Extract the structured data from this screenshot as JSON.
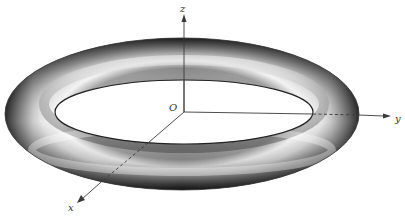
{
  "diagram": {
    "type": "torus-3d-axes",
    "origin_label": "O",
    "axes": [
      {
        "name": "x",
        "label": "x",
        "direction": "down-left"
      },
      {
        "name": "y",
        "label": "y",
        "direction": "right"
      },
      {
        "name": "z",
        "label": "z",
        "direction": "up"
      }
    ]
  },
  "colors": {
    "axis": "#3a3a3a",
    "torus_dark": "#1e1e1e",
    "torus_light": "#f5f5f5",
    "background": "#ffffff"
  }
}
